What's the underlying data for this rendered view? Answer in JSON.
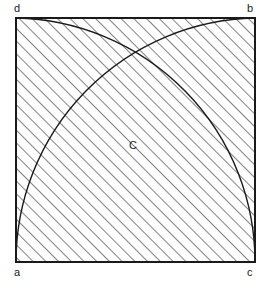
{
  "figure": {
    "background_color": "#ffffff",
    "stroke_color": "#1a1a1a",
    "hatch_color": "#1a1a1a",
    "square": {
      "left": 16,
      "top": 18,
      "right": 255,
      "bottom": 262,
      "width": 239,
      "height": 244,
      "border_width": 2
    },
    "vertices": [
      {
        "id": "a",
        "label": "a",
        "corner": "bottom-left",
        "x": 16,
        "y": 262
      },
      {
        "id": "b",
        "label": "b",
        "corner": "top-right",
        "x": 255,
        "y": 18
      },
      {
        "id": "c",
        "label": "c",
        "corner": "bottom-right",
        "x": 255,
        "y": 262
      },
      {
        "id": "d",
        "label": "d",
        "corner": "top-left",
        "x": 16,
        "y": 18
      }
    ],
    "arcs": [
      {
        "id": "arc-from-d-to-c",
        "center_vertex": "a",
        "start_vertex": "d",
        "end_vertex": "c",
        "description": "quarter circle centered at a, from d to c, bulging toward b"
      },
      {
        "id": "arc-from-a-to-b",
        "center_vertex": "c",
        "start_vertex": "a",
        "end_vertex": "b",
        "description": "quarter circle centered at c, from a to b, bulging toward d"
      }
    ],
    "regions": [
      {
        "id": "lens-region",
        "label": "C",
        "fill": "white",
        "description": "central unshaded lens between the two arcs",
        "label_x": 134,
        "label_y": 145
      },
      {
        "id": "upper-left-hatched",
        "label": "",
        "fill": "hatched",
        "description": "shaded region between arc d-c and corners d, a"
      },
      {
        "id": "lower-right-hatched",
        "label": "",
        "fill": "hatched",
        "description": "shaded region between arc a-b and corners b, c"
      }
    ],
    "hatching": {
      "angle_degrees": 45,
      "direction": "lower-left to upper-right",
      "spacing_px": 9,
      "line_width": 1.1,
      "color": "#1a1a1a"
    }
  }
}
